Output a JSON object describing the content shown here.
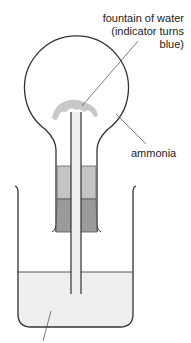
{
  "diagram": {
    "labels": {
      "fountain_line1": "fountain of water",
      "fountain_line2": "(indicator turns",
      "fountain_line3": "blue)",
      "ammonia": "ammonia"
    },
    "components": [
      "round-bottom flask",
      "fountain of water",
      "glass tube",
      "stopper (upper)",
      "stopper (lower)",
      "beaker",
      "water with indicator"
    ],
    "colors": {
      "outline": "#333333",
      "fountain": "#c8c8c8",
      "stopper_light": "#c4c4c4",
      "stopper_dark": "#9a9a9a",
      "tube": "#eeeeee",
      "water": "#efefef"
    }
  }
}
